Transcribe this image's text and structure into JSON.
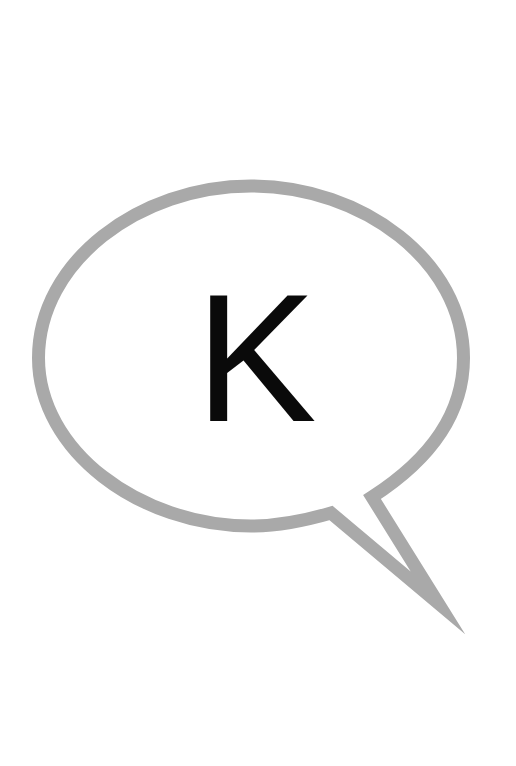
{
  "image": {
    "description": "speech bubble containing a single letter",
    "background_color": "#ffffff"
  },
  "bubble": {
    "icon": "speech-bubble-icon",
    "stroke_color": "#a9a9a9",
    "fill_color": "#ffffff",
    "stroke_width": 13
  },
  "letter": {
    "text": "K",
    "color": "#0a0a0a"
  }
}
